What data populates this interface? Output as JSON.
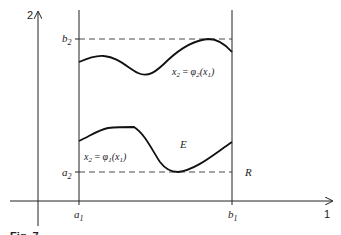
{
  "figure": {
    "axes": {
      "x_axis_label": "1",
      "y_axis_label": "2"
    },
    "bounds": {
      "a1": "a",
      "a1_sub": "1",
      "b1": "b",
      "b1_sub": "1",
      "a2": "a",
      "a2_sub": "2",
      "b2": "b",
      "b2_sub": "2"
    },
    "curves": {
      "upper": {
        "lhs": "x",
        "lhs_sub": "2",
        "eq": " = ",
        "fn": "φ",
        "fn_sub": "2",
        "arg_open": "(x",
        "arg_sub": "1",
        "arg_close": ")"
      },
      "lower": {
        "lhs": "x",
        "lhs_sub": "2",
        "eq": " = ",
        "fn": "φ",
        "fn_sub": "1",
        "arg_open": "(x",
        "arg_sub": "1",
        "arg_close": ")"
      }
    },
    "region_label": "E",
    "rectangle_label": "R",
    "caption_fragment": "Fig. 7"
  }
}
